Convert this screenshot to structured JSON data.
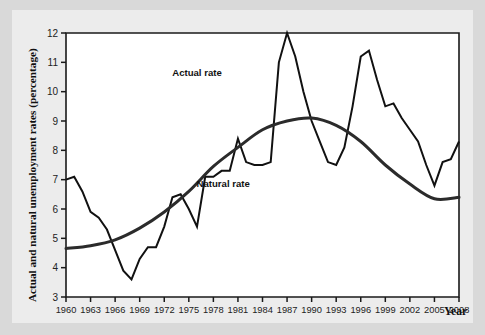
{
  "chart_data": {
    "type": "line",
    "title": "",
    "xlabel": "Year",
    "ylabel": "Actual and natural unemployment rates (percentage)",
    "xlim": [
      1960,
      2008
    ],
    "ylim": [
      3,
      12
    ],
    "grid": false,
    "legend_position": "inline-annotations",
    "y_ticks": [
      "3",
      "4",
      "5",
      "6",
      "7",
      "8",
      "9",
      "10",
      "11",
      "12"
    ],
    "x_ticks": [
      "1960",
      "1963",
      "1966",
      "1969",
      "1972",
      "1975",
      "1978",
      "1981",
      "1984",
      "1987",
      "1990",
      "1993",
      "1996",
      "1999",
      "2002",
      "2005",
      "2008"
    ],
    "x_tick_values": [
      1960,
      1963,
      1966,
      1969,
      1972,
      1975,
      1978,
      1981,
      1984,
      1987,
      1990,
      1993,
      1996,
      1999,
      2002,
      2005,
      2008
    ],
    "annotations": [
      {
        "name": "actual-rate-label",
        "text": "Actual rate",
        "x": 1976.0,
        "y": 10.55
      },
      {
        "name": "natural-rate-label",
        "text": "Natural rate",
        "x": 1979.2,
        "y": 6.75
      }
    ],
    "series": [
      {
        "name": "Actual rate",
        "color": "#111111",
        "x": [
          1960,
          1961,
          1962,
          1963,
          1964,
          1965,
          1966,
          1967,
          1968,
          1969,
          1970,
          1971,
          1972,
          1973,
          1974,
          1975,
          1976,
          1977,
          1978,
          1979,
          1980,
          1981,
          1982,
          1983,
          1984,
          1985,
          1986,
          1987,
          1988,
          1989,
          1990,
          1991,
          1992,
          1993,
          1994,
          1995,
          1996,
          1997,
          1998,
          1999,
          2000,
          2001,
          2002,
          2003,
          2004,
          2005,
          2006,
          2007,
          2008
        ],
        "values": [
          7.0,
          7.1,
          6.6,
          5.9,
          5.7,
          5.3,
          4.6,
          3.9,
          3.6,
          4.3,
          4.7,
          4.7,
          5.4,
          6.4,
          6.5,
          6.0,
          5.4,
          7.1,
          7.1,
          7.3,
          7.3,
          8.4,
          7.6,
          7.5,
          7.5,
          7.6,
          11.0,
          12.0,
          11.2,
          10.0,
          9.0,
          8.3,
          7.6,
          7.5,
          8.1,
          9.5,
          11.2,
          11.4,
          10.4,
          9.5,
          9.6,
          9.1,
          8.7,
          8.3,
          7.5,
          6.8,
          7.6,
          7.7,
          8.3
        ],
        "notes": "Series as plotted: peaks at 12.0 (1982), 11.4 (1992); troughs 3.6 (1966), 6.0 (2007)."
      },
      {
        "name": "Natural rate",
        "color": "#2b2b2b",
        "x": [
          1960,
          1963,
          1966,
          1969,
          1972,
          1975,
          1978,
          1981,
          1984,
          1987,
          1990,
          1993,
          1996,
          1999,
          2002,
          2005,
          2008
        ],
        "values": [
          4.65,
          4.75,
          4.95,
          5.35,
          5.9,
          6.6,
          7.45,
          8.1,
          8.7,
          9.0,
          9.1,
          8.85,
          8.3,
          7.5,
          6.85,
          6.35,
          6.4
        ],
        "notes": "Smooth inverted-U curve peaking near 9.1 around 1990."
      }
    ]
  }
}
